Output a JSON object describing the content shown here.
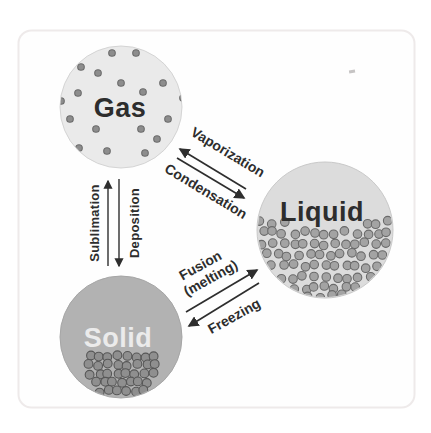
{
  "diagram": {
    "type": "states-of-matter-phase-changes",
    "background": "#ffffff"
  },
  "states": [
    {
      "id": "gas",
      "label": "Gas",
      "fill": "#eaeaea",
      "ring": "#d4d4d4",
      "label_color": "#2d2d2d"
    },
    {
      "id": "liquid",
      "label": "Liquid",
      "fill": "#dcdcdc",
      "ring": "#c9c9c9",
      "label_color": "#2d2d2d"
    },
    {
      "id": "solid",
      "label": "Solid",
      "fill": "#b2b2b2",
      "ring": "#a6a6a6",
      "label_color": "#ebebeb"
    }
  ],
  "transitions": [
    {
      "label": "Vaporization",
      "from": "liquid",
      "to": "gas"
    },
    {
      "label": "Condensation",
      "from": "gas",
      "to": "liquid"
    },
    {
      "label": "Sublimation",
      "from": "solid",
      "to": "gas"
    },
    {
      "label": "Deposition",
      "from": "gas",
      "to": "solid"
    },
    {
      "label": "Fusion (melting)",
      "label_lines": [
        "Fusion",
        "(melting)"
      ],
      "from": "solid",
      "to": "liquid"
    },
    {
      "label": "Freezing",
      "from": "liquid",
      "to": "solid"
    }
  ],
  "particles": {
    "gas": {
      "arrangement": "scattered",
      "radius": 3.3,
      "fill": "#8d8d8d",
      "stroke": "#6d6d6d",
      "dots": [
        [
          112,
          53
        ],
        [
          136,
          53
        ],
        [
          81,
          67
        ],
        [
          98,
          73
        ],
        [
          121,
          83
        ],
        [
          163,
          83
        ],
        [
          78,
          93
        ],
        [
          143,
          92
        ],
        [
          61,
          101
        ],
        [
          183,
          98
        ],
        [
          70,
          119
        ],
        [
          96,
          129
        ],
        [
          141,
          129
        ],
        [
          168,
          119
        ],
        [
          157,
          139
        ],
        [
          79,
          148
        ],
        [
          107,
          151
        ],
        [
          145,
          153
        ]
      ]
    },
    "liquid": {
      "arrangement": "packed-loose",
      "radius": 4.3,
      "fill": "#a3a3a3",
      "stroke": "#6a6a6a",
      "step": 10.5,
      "jitter": 2.2,
      "rows": [
        {
          "y": 222,
          "segments": [
            [
              259,
              284
            ],
            [
              366,
              389
            ]
          ]
        },
        {
          "y": 233,
          "segments": [
            [
              262,
              388
            ]
          ]
        },
        {
          "y": 244,
          "segments": [
            [
              263,
              386
            ]
          ]
        },
        {
          "y": 255,
          "segments": [
            [
              267,
              383
            ]
          ]
        },
        {
          "y": 266,
          "segments": [
            [
              272,
              378
            ]
          ]
        },
        {
          "y": 277,
          "segments": [
            [
              281,
              369
            ]
          ]
        },
        {
          "y": 288,
          "segments": [
            [
              295,
              355
            ]
          ]
        },
        {
          "y": 296,
          "segments": [
            [
              309,
              341
            ]
          ]
        }
      ]
    },
    "solid": {
      "arrangement": "packed-grid",
      "radius": 4.4,
      "fill": "#8f8f8f",
      "stroke": "#575757",
      "step": 9.2,
      "jitter": 1.6,
      "rows": [
        {
          "y": 356,
          "segments": [
            [
              90,
              155
            ]
          ]
        },
        {
          "y": 365,
          "segments": [
            [
              88,
              156
            ]
          ]
        },
        {
          "y": 374,
          "segments": [
            [
              91,
              153
            ]
          ]
        },
        {
          "y": 383,
          "segments": [
            [
              95,
              148
            ]
          ]
        },
        {
          "y": 391,
          "segments": [
            [
              101,
              143
            ]
          ]
        }
      ]
    }
  }
}
